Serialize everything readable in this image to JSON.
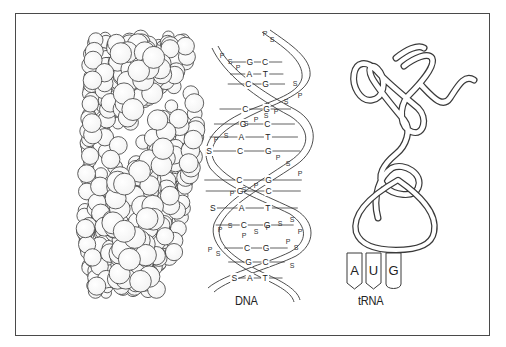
{
  "figure": {
    "labels": {
      "dna": "DNA",
      "trna": "tRNA"
    },
    "anticodon": [
      "A",
      "U",
      "G"
    ],
    "helix_rungs": [
      {
        "y": 62,
        "left": "G",
        "right": "C",
        "s_left": false
      },
      {
        "y": 74,
        "left": "A",
        "right": "T",
        "s_left": false
      },
      {
        "y": 84,
        "left": "C",
        "right": "G",
        "s_left": false
      },
      {
        "y": 109,
        "left": "C",
        "right": "G",
        "s_left": false
      },
      {
        "y": 124,
        "left": "G",
        "right": "C",
        "s_left": false
      },
      {
        "y": 137,
        "left": "A",
        "right": "T",
        "s_left": false
      },
      {
        "y": 151,
        "left": "C",
        "right": "G",
        "s_left": true
      },
      {
        "y": 180,
        "left": "C",
        "right": "G",
        "s_left": false
      },
      {
        "y": 191,
        "left": "G",
        "right": "C",
        "s_left": false
      },
      {
        "y": 208,
        "left": "A",
        "right": "T",
        "s_left": true
      },
      {
        "y": 225,
        "left": "C",
        "right": "G",
        "s_left": false
      },
      {
        "y": 248,
        "left": "C",
        "right": "G",
        "s_left": false
      },
      {
        "y": 262,
        "left": "G",
        "right": "C",
        "s_left": false
      },
      {
        "y": 278,
        "left": "A",
        "right": "T",
        "s_left": true
      }
    ],
    "backbone_pattern": "S — P — S — P — S — P — S — P — S",
    "colors": {
      "stroke": "#3a3a3a",
      "border": "#4a4a4a",
      "background": "#ffffff",
      "text": "#222222"
    }
  }
}
